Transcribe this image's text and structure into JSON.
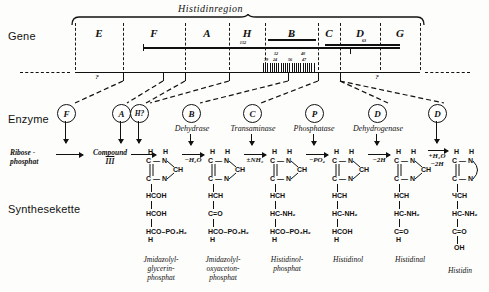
{
  "figure": {
    "region_title": "Histidinregion",
    "row_labels": {
      "gene": "Gene",
      "enzyme": "Enzyme",
      "chain": "Synthesekette"
    }
  },
  "gene_map": {
    "genes": [
      {
        "letter": "E",
        "x": 75,
        "w": 48
      },
      {
        "letter": "F",
        "x": 123,
        "w": 62
      },
      {
        "letter": "A",
        "x": 185,
        "w": 44
      },
      {
        "letter": "H",
        "x": 229,
        "w": 36
      },
      {
        "letter": "B",
        "x": 265,
        "w": 53
      },
      {
        "letter": "C",
        "x": 318,
        "w": 22
      },
      {
        "letter": "D",
        "x": 340,
        "w": 40
      },
      {
        "letter": "G",
        "x": 380,
        "w": 40
      }
    ],
    "deletion_bars": [
      {
        "label": "22",
        "x": 271,
        "w": 42,
        "y": 38
      },
      {
        "label": "63",
        "x": 348,
        "w": 52,
        "y": 40
      }
    ],
    "marker_152": "152",
    "marker_63": "63",
    "marker_22": "22",
    "mutation_numbers_top": [
      "12",
      "40"
    ],
    "mutation_numbers_bottom": [
      "79",
      "24",
      "56",
      "47"
    ],
    "unknown_left": "?",
    "unknown_right": "?"
  },
  "enzymes": [
    {
      "symbol": "F",
      "name": "",
      "x": 64,
      "circle_only": true
    },
    {
      "symbol": "A",
      "name": "",
      "x": 119,
      "circle_only": true
    },
    {
      "symbol": "H?",
      "name": "",
      "x": 138,
      "circle_only": true
    },
    {
      "symbol": "B",
      "name": "Dehydrase",
      "x": 190
    },
    {
      "symbol": "C",
      "name": "Transaminase",
      "x": 251
    },
    {
      "symbol": "P",
      "name": "Phosphatase",
      "x": 313
    },
    {
      "symbol": "D",
      "name": "Dehydrogenase",
      "x": 376
    },
    {
      "symbol": "D",
      "name": "",
      "x": 436,
      "circle_only": true
    }
  ],
  "pathway": {
    "start_compound": [
      "Ribose -",
      "phosphat"
    ],
    "intermediate": [
      "Compound",
      "III"
    ],
    "reagents": [
      "−H₂O",
      "±NH₂",
      "−PO₄",
      "−2H",
      "+H₂O"
    ],
    "reagent_second_line": "−2H",
    "structures": [
      {
        "x": 146,
        "ring": {
          "n1": "H",
          "n2": "H",
          "c1": "C — N",
          "c2": "C — N",
          "ch": "CH"
        },
        "chain": [
          "HCOH",
          "HCOH",
          "HCO–PO₃H₂",
          "H"
        ],
        "name": [
          "Jmidazolyl-",
          "glycerin-",
          "phosphat"
        ]
      },
      {
        "x": 208,
        "ring": {
          "n1": "H",
          "n2": "H",
          "c1": "C — N",
          "c2": "C — N",
          "ch": "CH"
        },
        "chain": [
          "HCH",
          "C=O",
          "HCO–PO₃H₂",
          "H"
        ],
        "name": [
          "Jmidazolyl-",
          "oxyaceton-",
          "phosphat"
        ]
      },
      {
        "x": 270,
        "ring": {
          "n1": "H",
          "n2": "H",
          "c1": "C — N",
          "c2": "C — N",
          "ch": "CH"
        },
        "chain": [
          "HCH",
          "HC-NH₂",
          "HCO–PO₃H₂",
          "H"
        ],
        "name": [
          "Histidinol-",
          "phosphat"
        ]
      },
      {
        "x": 332,
        "ring": {
          "n1": "H",
          "n2": "H",
          "c1": "C — N",
          "c2": "C — N",
          "ch": "CH"
        },
        "chain": [
          "HCH",
          "HC-NH₂",
          "HCOH",
          "H"
        ],
        "name": [
          "Histidinol"
        ]
      },
      {
        "x": 394,
        "ring": {
          "n1": "H",
          "n2": "H",
          "c1": "C — N",
          "c2": "C — N",
          "ch": "CH"
        },
        "chain": [
          "HCH",
          "HC-NH₂",
          "C=O",
          "H"
        ],
        "name": [
          "Histidinal"
        ]
      },
      {
        "x": 452,
        "ring": {
          "n1": "H",
          "n2": "H",
          "c1": "C — N",
          "c2": "C — N",
          "ch": "CH"
        },
        "chain": [
          "ЧCH",
          "HC-NH₂",
          "C=O",
          "OH"
        ],
        "name": [
          "Histidin"
        ]
      }
    ]
  }
}
